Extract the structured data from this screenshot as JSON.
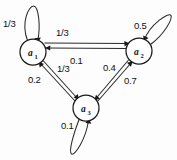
{
  "diagram": {
    "type": "state-transition-diagram",
    "title": "",
    "nodes": [
      {
        "id": "a1",
        "label": "a",
        "subscript": "1",
        "cx": 33,
        "cy": 52,
        "r": 13
      },
      {
        "id": "a2",
        "label": "a",
        "subscript": "2",
        "cx": 139,
        "cy": 51,
        "r": 13
      },
      {
        "id": "a3",
        "label": "a",
        "subscript": "3",
        "cx": 86,
        "cy": 108,
        "r": 13
      }
    ],
    "self_loops": [
      {
        "id": "loop-a1",
        "node": "a1",
        "weight": "1/3",
        "direction": "up",
        "label_x": 3,
        "label_y": 17
      },
      {
        "id": "loop-a2",
        "node": "a2",
        "weight": "0.5",
        "direction": "up-right",
        "label_x": 134,
        "label_y": 19
      },
      {
        "id": "loop-a3",
        "node": "a3",
        "weight": "0.1",
        "direction": "down",
        "label_x": 61,
        "label_y": 119
      }
    ],
    "edges": [
      {
        "id": "e-a1-a2",
        "from": "a1",
        "to": "a2",
        "weight": "1/3",
        "label_x": 56,
        "label_y": 26
      },
      {
        "id": "e-a2-a1",
        "from": "a2",
        "to": "a1",
        "weight": "0.1",
        "label_x": 70,
        "label_y": 54
      },
      {
        "id": "e-a1-a3",
        "from": "a1",
        "to": "a3",
        "weight": "1/3",
        "label_x": 57,
        "label_y": 62
      },
      {
        "id": "e-a3-a1",
        "from": "a3",
        "to": "a1",
        "weight": "0.2",
        "label_x": 28,
        "label_y": 73
      },
      {
        "id": "e-a2-a3",
        "from": "a2",
        "to": "a3",
        "weight": "0.4",
        "label_x": 103,
        "label_y": 61
      },
      {
        "id": "e-a3-a2",
        "from": "a3",
        "to": "a2",
        "weight": "0.7",
        "label_x": 124,
        "label_y": 74
      }
    ],
    "colors": {
      "stroke": "#2a2a2a",
      "node_fill": "#ffffff",
      "text": "#101010",
      "background": "#fdfdfd"
    }
  }
}
